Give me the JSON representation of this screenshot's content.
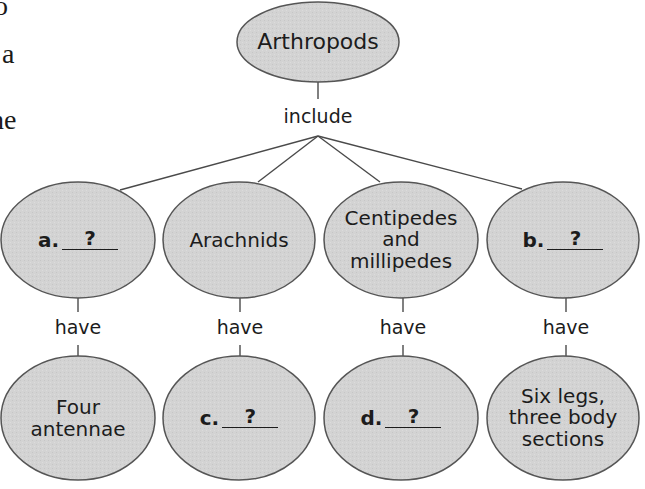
{
  "margin_text": {
    "fragments": [
      "o",
      "a",
      "he"
    ]
  },
  "diagram": {
    "root": {
      "label": "Arthropods"
    },
    "root_connector": "include",
    "groups": [
      {
        "id": "a",
        "label": null,
        "blank_letter": "a.",
        "blank_mark": "?",
        "connector": "have",
        "trait": {
          "label": "Four antennae",
          "lines": [
            "Four",
            "antennae"
          ]
        }
      },
      {
        "id": "arachnids",
        "label": "Arachnids",
        "lines": [
          "Arachnids"
        ],
        "connector": "have",
        "trait": {
          "label": null,
          "blank_letter": "c.",
          "blank_mark": "?"
        }
      },
      {
        "id": "centipedes",
        "label": "Centipedes and millipedes",
        "lines": [
          "Centipedes",
          "and",
          "millipedes"
        ],
        "connector": "have",
        "trait": {
          "label": null,
          "blank_letter": "d.",
          "blank_mark": "?"
        }
      },
      {
        "id": "b",
        "label": null,
        "blank_letter": "b.",
        "blank_mark": "?",
        "connector": "have",
        "trait": {
          "label": "Six legs, three body sections",
          "lines": [
            "Six legs,",
            "three body",
            "sections"
          ]
        }
      }
    ]
  },
  "colors": {
    "ellipse_fill": "#d2d2d2",
    "ellipse_stroke": "#555555",
    "line": "#4a4a4a",
    "text": "#1c1c1c"
  }
}
